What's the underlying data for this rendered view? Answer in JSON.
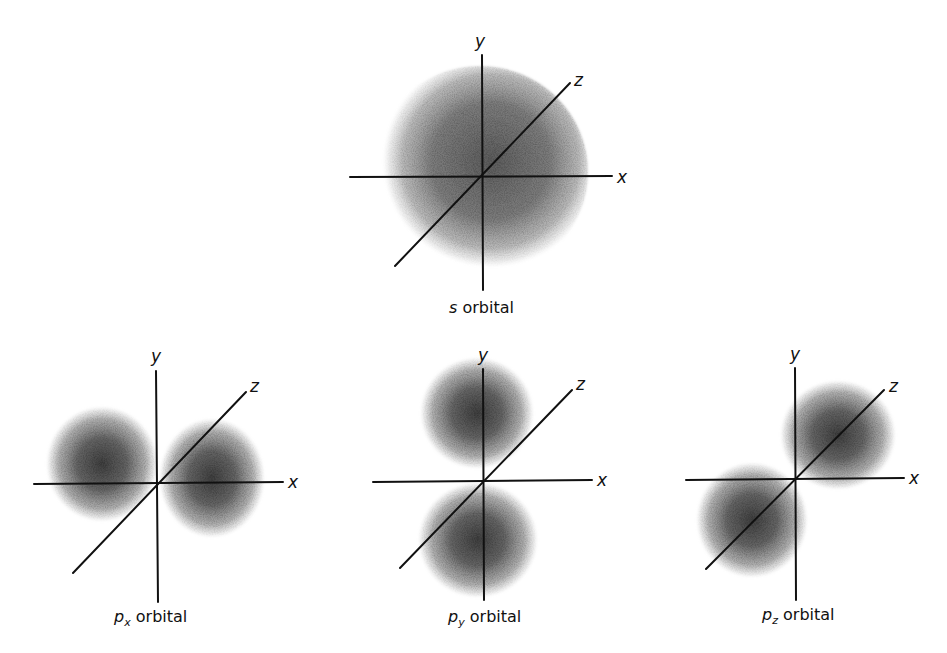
{
  "figure": {
    "panels": [
      {
        "id": "s",
        "caption_prefix": "s",
        "caption_sub": "",
        "caption_suffix": " orbital",
        "axes": {
          "x": "x",
          "y": "y",
          "z": "z"
        }
      },
      {
        "id": "px",
        "caption_prefix": "p",
        "caption_sub": "x",
        "caption_suffix": " orbital",
        "axes": {
          "x": "x",
          "y": "y",
          "z": "z"
        }
      },
      {
        "id": "py",
        "caption_prefix": "p",
        "caption_sub": "y",
        "caption_suffix": " orbital",
        "axes": {
          "x": "x",
          "y": "y",
          "z": "z"
        }
      },
      {
        "id": "pz",
        "caption_prefix": "p",
        "caption_sub": "z",
        "caption_suffix": " orbital",
        "axes": {
          "x": "x",
          "y": "y",
          "z": "z"
        }
      }
    ]
  },
  "colors": {
    "axis": "#111111",
    "cloud_dark": "#3a3a3a",
    "cloud_light": "#bdbdbd",
    "background": "#ffffff"
  }
}
